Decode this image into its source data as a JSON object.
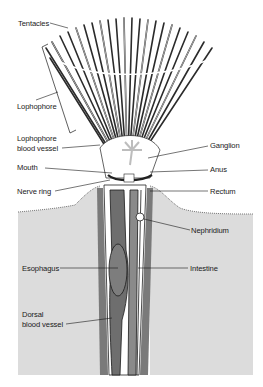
{
  "figure": {
    "colors": {
      "sediment": "#dcdcdc",
      "tube": "#8a8a8a",
      "gut": "#6e6e6e",
      "tentacle": "#2b2b2b",
      "line": "#1a1a1a"
    }
  },
  "labels": {
    "tentacles": "Tentacles",
    "lophophore": "Lophophore",
    "lophophore_blood_vessel_1": "Lophophore",
    "lophophore_blood_vessel_2": "blood vessel",
    "ganglion": "Ganglion",
    "mouth": "Mouth",
    "anus": "Anus",
    "nerve_ring": "Nerve ring",
    "rectum": "Rectum",
    "nephridium": "Nephridium",
    "esophagus": "Esophagus",
    "intestine": "Intestine",
    "dorsal_blood_vessel_1": "Dorsal",
    "dorsal_blood_vessel_2": "blood vessel"
  }
}
